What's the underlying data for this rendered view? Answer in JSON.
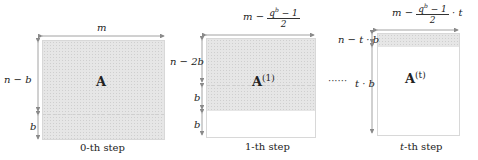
{
  "diagram": {
    "steps": [
      {
        "id": "step-0",
        "matrix_label": "A",
        "matrix_superscript": "",
        "width_label": "m",
        "height_labels": [
          "n − b",
          "b"
        ],
        "caption": "0-th step"
      },
      {
        "id": "step-1",
        "matrix_label": "A",
        "matrix_superscript": "(1)",
        "width_label_prefix": "m −",
        "width_label_numerator": "q",
        "width_label_numerator_sup": "b",
        "width_label_numerator_rest": " − 1",
        "width_label_denominator": "2",
        "width_label_suffix": "",
        "height_labels": [
          "n − 2b",
          "b",
          "b"
        ],
        "caption": "1-th step"
      },
      {
        "id": "step-t",
        "matrix_label": "A",
        "matrix_superscript": "(t)",
        "width_label_prefix": "m −",
        "width_label_numerator": "q",
        "width_label_numerator_sup": "b",
        "width_label_numerator_rest": " − 1",
        "width_label_denominator": "2",
        "width_label_suffix": "· t",
        "height_labels": [
          "n − t · b",
          "t · b"
        ],
        "caption_italic": "t",
        "caption": "-th step"
      }
    ],
    "ellipsis": "······"
  },
  "colors": {
    "shade": "#e6e6e6",
    "border": "#d8d8d8",
    "arrow": "#8a8a8a",
    "text": "#222222"
  }
}
